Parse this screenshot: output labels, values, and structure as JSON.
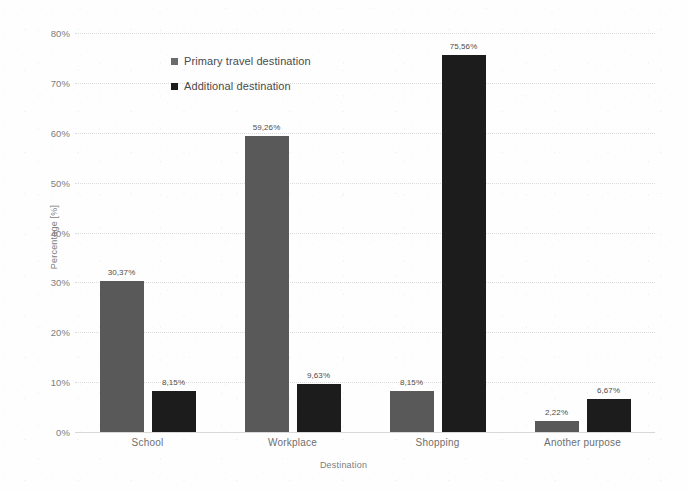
{
  "chart_data": {
    "type": "bar",
    "title": "",
    "xlabel": "Destination",
    "ylabel": "Percentage [%]",
    "categories": [
      "School",
      "Workplace",
      "Shopping",
      "Another purpose"
    ],
    "series": [
      {
        "name": "Primary travel destination",
        "color": "#595959",
        "values": [
          30.37,
          59.26,
          8.15,
          2.22
        ],
        "value_labels": [
          "30,37%",
          "59,26%",
          "8,15%",
          "2,22%"
        ]
      },
      {
        "name": "Additional destination",
        "color": "#1c1c1c",
        "values": [
          8.15,
          9.63,
          75.56,
          6.67
        ],
        "value_labels": [
          "8,15%",
          "9,63%",
          "75,56%",
          "6,67%"
        ]
      }
    ],
    "ylim": [
      0,
      80
    ],
    "ytick_values": [
      0,
      10,
      20,
      30,
      40,
      50,
      60,
      70,
      80
    ],
    "ytick_labels": [
      "0%",
      "10%",
      "20%",
      "30%",
      "40%",
      "50%",
      "60%",
      "70%",
      "80%"
    ],
    "grid": true,
    "legend_position": "upper-left-inside",
    "decimal_separator": ","
  },
  "axes": {
    "y_title": "Percentage [%]",
    "x_title": "Destination"
  },
  "legend": {
    "entries": [
      {
        "label": "Primary travel destination",
        "marker": "square-gray"
      },
      {
        "label": "Additional destination",
        "marker": "square-black"
      }
    ]
  }
}
